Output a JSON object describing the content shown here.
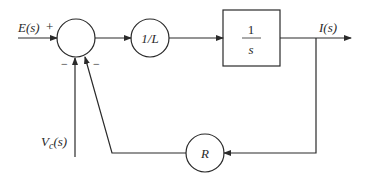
{
  "diagram": {
    "type": "block-diagram",
    "inputs": {
      "e": "E(s)",
      "vc_main": "V",
      "vc_sub": "c",
      "vc_tail": "(s)"
    },
    "signs": {
      "plus": "+",
      "minus_left": "−",
      "minus_right": "−"
    },
    "blocks": {
      "gain_l": "1/L",
      "integrator_num": "1",
      "integrator_den": "s",
      "resistor": "R"
    },
    "output": "I(s)",
    "colors": {
      "stroke": "#2a2a2a",
      "background": "#ffffff"
    }
  }
}
